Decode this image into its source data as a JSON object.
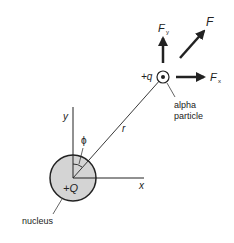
{
  "labels": {
    "force": "F",
    "force_y": "F",
    "force_y_sub": "y",
    "force_x": "F",
    "force_x_sub": "x",
    "particle_charge": "+q",
    "particle_name_line1": "alpha",
    "particle_name_line2": "particle",
    "distance": "r",
    "angle": "ϕ",
    "axis_y": "y",
    "axis_x": "x",
    "nucleus_charge": "+Q",
    "nucleus_name": "nucleus"
  },
  "colors": {
    "nucleus_fill": "#d4d4d4",
    "stroke": "#222222"
  }
}
